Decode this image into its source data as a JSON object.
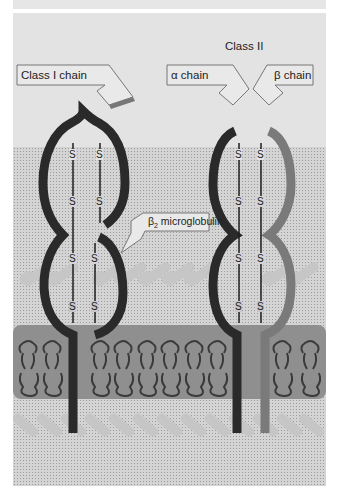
{
  "diagram": {
    "class2_heading": "Class II",
    "labels": {
      "class1_chain": "Class I chain",
      "alpha_chain": "α chain",
      "beta_chain": "β chain",
      "b2m_symbol": "β",
      "b2m_sub": "2",
      "b2m_text": " microglobulin"
    },
    "disulfide_symbol": "S",
    "colors": {
      "background": "#e3e3e3",
      "extracellular_stipple": "#d4d4d4",
      "membrane": "#8e8e8e",
      "class1_chain": "#2a2a2a",
      "alpha_chain": "#2a2a2a",
      "beta_chain": "#7a7a7a",
      "lipid_heads": "#c4c4c4"
    }
  }
}
